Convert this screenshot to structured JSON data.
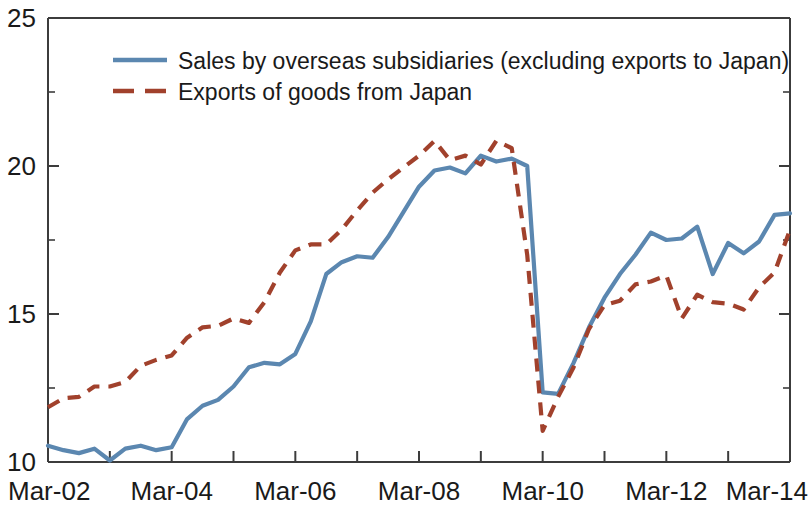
{
  "chart_data": {
    "type": "line",
    "title": "",
    "subtitle": "",
    "xlabel": "",
    "ylabel": "",
    "ylim": [
      10,
      25
    ],
    "xlim": [
      2002.0,
      2014.0
    ],
    "grid": false,
    "legend_position": "top-left",
    "y_ticks_major": [
      10,
      15,
      20,
      25
    ],
    "y_ticks_minor": [
      12.5,
      17.5,
      22.5
    ],
    "y_tick_labels": [
      "10",
      "15",
      "20",
      "25"
    ],
    "x_tick_labels": [
      "Mar-02",
      "Mar-04",
      "Mar-06",
      "Mar-08",
      "Mar-10",
      "Mar-12",
      "Mar-14"
    ],
    "x_tick_values": [
      2002,
      2004,
      2006,
      2008,
      2010,
      2012,
      2014
    ],
    "x_minor_tick_values": [
      2003,
      2005,
      2007,
      2009,
      2011,
      2013
    ],
    "colors": {
      "series_blue": "#5b87b0",
      "series_red": "#a1412c",
      "axis": "#3c3c3c",
      "text": "#1a1a1a",
      "background": "#ffffff"
    },
    "series": [
      {
        "name": "Sales by overseas subsidiaries (excluding exports to Japan)",
        "style": "solid",
        "color": "#5b87b0",
        "x": [
          2002.0,
          2002.25,
          2002.5,
          2002.75,
          2003.0,
          2003.25,
          2003.5,
          2003.75,
          2004.0,
          2004.25,
          2004.5,
          2004.75,
          2005.0,
          2005.25,
          2005.5,
          2005.75,
          2006.0,
          2006.25,
          2006.5,
          2006.75,
          2007.0,
          2007.25,
          2007.5,
          2007.75,
          2008.0,
          2008.25,
          2008.5,
          2008.75,
          2009.0,
          2009.25,
          2009.5,
          2009.75,
          2010.0,
          2010.25,
          2010.5,
          2010.75,
          2011.0,
          2011.25,
          2011.5,
          2011.75,
          2012.0,
          2012.25,
          2012.5,
          2012.75,
          2013.0,
          2013.25,
          2013.5,
          2013.75,
          2014.0
        ],
        "values": [
          10.55,
          10.4,
          10.3,
          10.45,
          10.05,
          10.45,
          10.55,
          10.4,
          10.5,
          11.45,
          11.9,
          12.1,
          12.55,
          13.2,
          13.35,
          13.3,
          13.65,
          14.75,
          16.35,
          16.75,
          16.95,
          16.9,
          17.6,
          18.45,
          19.3,
          19.85,
          19.95,
          19.75,
          20.35,
          20.15,
          20.25,
          20.0,
          12.35,
          12.3,
          13.35,
          14.55,
          15.55,
          16.35,
          17.0,
          17.75,
          17.5,
          17.55,
          17.95,
          16.35,
          17.4,
          17.05,
          17.45,
          18.35,
          18.4
        ]
      },
      {
        "name": "Exports of goods from Japan",
        "style": "dashed",
        "color": "#a1412c",
        "x": [
          2002.0,
          2002.25,
          2002.5,
          2002.75,
          2003.0,
          2003.25,
          2003.5,
          2003.75,
          2004.0,
          2004.25,
          2004.5,
          2004.75,
          2005.0,
          2005.25,
          2005.5,
          2005.75,
          2006.0,
          2006.25,
          2006.5,
          2006.75,
          2007.0,
          2007.25,
          2007.5,
          2007.75,
          2008.0,
          2008.25,
          2008.5,
          2008.75,
          2009.0,
          2009.25,
          2009.5,
          2009.75,
          2010.0,
          2010.25,
          2010.5,
          2010.75,
          2011.0,
          2011.25,
          2011.5,
          2011.75,
          2012.0,
          2012.25,
          2012.5,
          2012.75,
          2013.0,
          2013.25,
          2013.5,
          2013.75,
          2014.0
        ],
        "values": [
          11.85,
          12.15,
          12.2,
          12.55,
          12.55,
          12.7,
          13.25,
          13.45,
          13.6,
          14.2,
          14.55,
          14.6,
          14.85,
          14.7,
          15.4,
          16.4,
          17.15,
          17.35,
          17.35,
          17.85,
          18.5,
          19.1,
          19.55,
          19.95,
          20.35,
          20.85,
          20.2,
          20.35,
          20.05,
          20.85,
          20.6,
          17.0,
          11.05,
          12.2,
          13.2,
          14.5,
          15.3,
          15.45,
          16.0,
          16.1,
          16.3,
          14.85,
          15.65,
          15.4,
          15.35,
          15.15,
          15.9,
          16.4,
          17.85
        ]
      }
    ]
  },
  "legend": {
    "entries": [
      {
        "label": "Sales by overseas subsidiaries (excluding exports to Japan)",
        "style": "solid",
        "color": "#5b87b0"
      },
      {
        "label": "Exports of goods from Japan",
        "style": "dashed",
        "color": "#a1412c"
      }
    ]
  },
  "axis": {
    "y_labels": [
      "25",
      "20",
      "15",
      "10"
    ],
    "x_labels": [
      "Mar-02",
      "Mar-04",
      "Mar-06",
      "Mar-08",
      "Mar-10",
      "Mar-12",
      "Mar-14"
    ]
  }
}
